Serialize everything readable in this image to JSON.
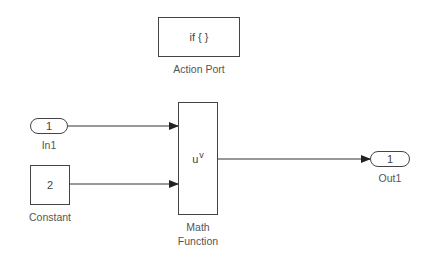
{
  "diagram": {
    "blocks": {
      "action_port": {
        "content": "if { }",
        "label": "Action Port"
      },
      "in1": {
        "content": "1",
        "label": "In1"
      },
      "constant": {
        "content": "2",
        "label": "Constant"
      },
      "math_function": {
        "content_base": "u",
        "content_sup": "v",
        "label_line1": "Math",
        "label_line2": "Function"
      },
      "out1": {
        "content": "1",
        "label": "Out1"
      }
    },
    "connections": [
      {
        "from": "In1",
        "to": "Math Function (input 1)"
      },
      {
        "from": "Constant",
        "to": "Math Function (input 2)"
      },
      {
        "from": "Math Function",
        "to": "Out1"
      }
    ],
    "colors": {
      "line": "#333333",
      "border": "#444444",
      "background": "#ffffff"
    }
  }
}
